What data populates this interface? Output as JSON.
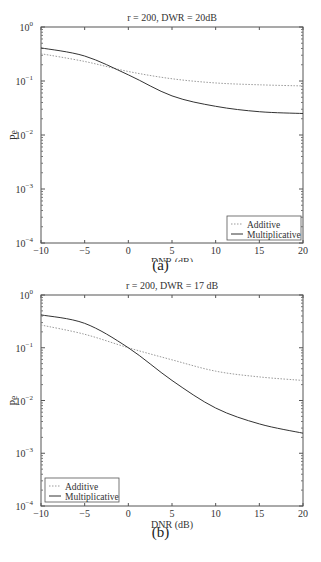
{
  "chart_data": [
    {
      "type": "line",
      "panel": "(a)",
      "title": "r = 200, DWR = 20dB",
      "xlabel": "DNR (dB)",
      "ylabel": "Pe",
      "xlim": [
        -10,
        20
      ],
      "ylim": [
        0.0001,
        1
      ],
      "yscale": "log",
      "xticks": [
        -10,
        -5,
        0,
        5,
        10,
        15,
        20
      ],
      "yticks": [
        "10^0",
        "10^-1",
        "10^-2",
        "10^-3",
        "10^-4"
      ],
      "legend_position": "lower right",
      "grid": false,
      "x": [
        -10,
        -5,
        0,
        5,
        10,
        15,
        20
      ],
      "series": [
        {
          "name": "Additive",
          "style": "dotted",
          "values": [
            0.32,
            0.23,
            0.15,
            0.11,
            0.092,
            0.085,
            0.081
          ]
        },
        {
          "name": "Multiplicative",
          "style": "solid",
          "values": [
            0.41,
            0.29,
            0.13,
            0.053,
            0.034,
            0.027,
            0.025
          ]
        }
      ]
    },
    {
      "type": "line",
      "panel": "(b)",
      "title": "r = 200, DWR = 17 dB",
      "xlabel": "DNR (dB)",
      "ylabel": "Pe",
      "xlim": [
        -10,
        20
      ],
      "ylim": [
        0.0001,
        1
      ],
      "yscale": "log",
      "xticks": [
        -10,
        -5,
        0,
        5,
        10,
        15,
        20
      ],
      "yticks": [
        "10^0",
        "10^-1",
        "10^-2",
        "10^-3",
        "10^-4"
      ],
      "legend_position": "lower left",
      "grid": false,
      "x": [
        -10,
        -5,
        0,
        5,
        10,
        15,
        20
      ],
      "series": [
        {
          "name": "Additive",
          "style": "dotted",
          "values": [
            0.27,
            0.18,
            0.1,
            0.059,
            0.036,
            0.028,
            0.024
          ]
        },
        {
          "name": "Multiplicative",
          "style": "solid",
          "values": [
            0.42,
            0.29,
            0.1,
            0.024,
            0.0072,
            0.0036,
            0.0024
          ]
        }
      ]
    }
  ],
  "captions": [
    "(a)",
    "(b)"
  ]
}
